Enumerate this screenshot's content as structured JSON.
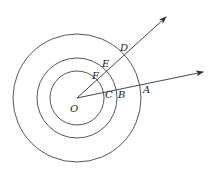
{
  "diagram": {
    "type": "concentric-circles-with-rays",
    "center": {
      "label": "O",
      "x": 77,
      "y": 98
    },
    "circles": [
      {
        "name": "inner",
        "r": 27
      },
      {
        "name": "middle",
        "r": 40
      },
      {
        "name": "outer",
        "r": 64
      }
    ],
    "rays": [
      {
        "name": "ray-upper",
        "end": {
          "x": 166,
          "y": 17
        }
      },
      {
        "name": "ray-lower",
        "end": {
          "x": 203,
          "y": 72
        }
      }
    ],
    "labels": {
      "O": "O",
      "A": "A",
      "B": "B",
      "C": "C",
      "D": "D",
      "E": "E",
      "F": "F"
    },
    "colors": {
      "stroke": "#444444",
      "text": "#222222",
      "background": "#ffffff"
    }
  }
}
